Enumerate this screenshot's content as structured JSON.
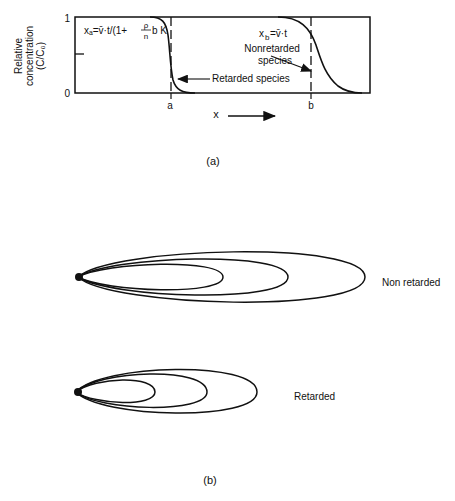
{
  "panel_a": {
    "ylabel_lines": [
      "Relative",
      "concentration",
      "(C/C₀)"
    ],
    "ytick_top": "1",
    "ytick_bottom": "0",
    "eq_a": "xₐ=v̄·t/(1+",
    "eq_a_frac_num": "ρ",
    "eq_a_frac_den": "n",
    "eq_a_tail": "b K",
    "eq_a_sub": "d",
    "eq_a_close": ")",
    "eq_b": "x",
    "eq_b_sub": "b",
    "eq_b_rest": "=v̄·t",
    "nonretarded_line1": "Nonretarded",
    "nonretarded_line2": "species",
    "retarded_label": "Retarded species",
    "xtick_a": "a",
    "xtick_b": "b",
    "xlabel": "x",
    "caption": "(a)"
  },
  "panel_b": {
    "nonretarded_label": "Non retarded",
    "retarded_label": "Retarded",
    "caption": "(b)"
  }
}
